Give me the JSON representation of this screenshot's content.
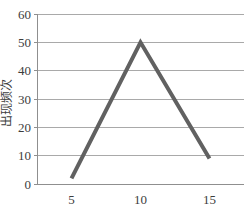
{
  "chart_data": {
    "type": "line",
    "x": [
      5,
      10,
      15
    ],
    "y": [
      2,
      50,
      9
    ],
    "title": "",
    "xlabel": "",
    "ylabel": "出现频次",
    "xticks": [
      5,
      10,
      15
    ],
    "yticks": [
      0,
      10,
      20,
      30,
      40,
      50,
      60
    ],
    "xlim": [
      2.5,
      17.5
    ],
    "ylim": [
      0,
      60
    ],
    "grid": "horizontal",
    "legend": "none",
    "colors": {
      "line": "#616161",
      "grid": "#a9a9a9",
      "axis": "#8f8f8f",
      "text": "#3d3d3d",
      "background": "#ffffff"
    }
  }
}
